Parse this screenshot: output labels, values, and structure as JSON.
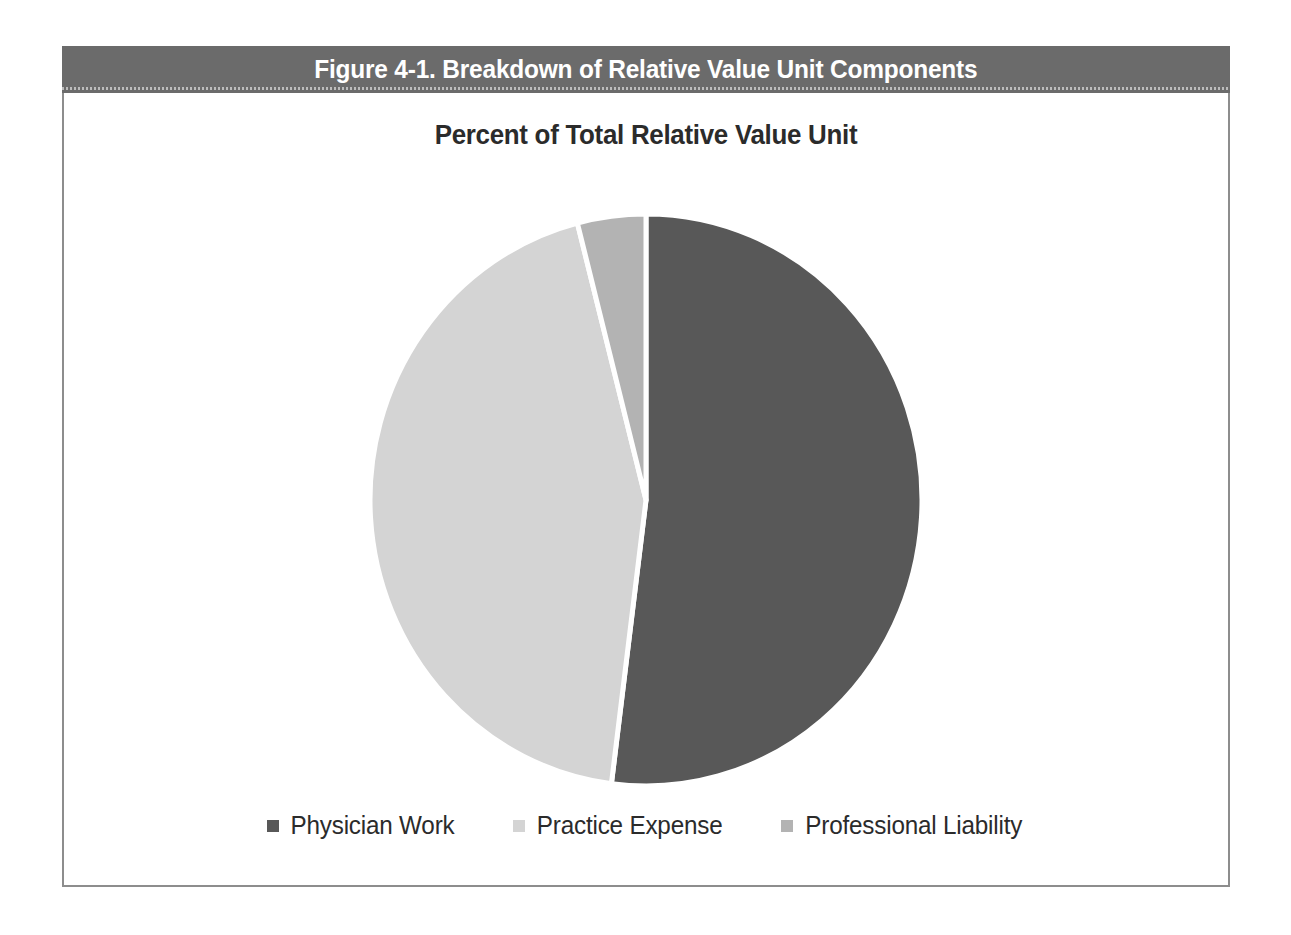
{
  "figure": {
    "header_title": "Figure 4-1. Breakdown of Relative Value Unit Components",
    "header_bg": "#6b6b6b",
    "frame_border": "#8d8d8d"
  },
  "chart_data": {
    "type": "pie",
    "title": "Percent of Total Relative Value Unit",
    "xlabel": "",
    "ylabel": "",
    "categories": [
      "Physician Work",
      "Practice Expense",
      "Professional Liability"
    ],
    "values": [
      52,
      44,
      4
    ],
    "units": "percent",
    "colors": [
      "#585858",
      "#d4d4d4",
      "#b3b3b3"
    ],
    "slice_separator_color": "#ffffff",
    "start_angle_deg": 0,
    "direction": "clockwise",
    "grid": false,
    "legend_position": "bottom",
    "data_labels_visible": false,
    "slices": [
      {
        "label": "Physician Work",
        "value": 52,
        "color": "#585858",
        "start_deg": 0,
        "end_deg": 187.2
      },
      {
        "label": "Practice Expense",
        "value": 44,
        "color": "#d4d4d4",
        "start_deg": 187.2,
        "end_deg": 345.6
      },
      {
        "label": "Professional Liability",
        "value": 4,
        "color": "#b3b3b3",
        "start_deg": 345.6,
        "end_deg": 360
      }
    ]
  },
  "legend": {
    "items": [
      {
        "label": "Physician Work",
        "marker": "square-marker-dark",
        "color": "#585858"
      },
      {
        "label": "Practice Expense",
        "marker": "square-marker-light",
        "color": "#d4d4d4"
      },
      {
        "label": "Professional Liability",
        "marker": "square-marker-medium",
        "color": "#b3b3b3"
      }
    ]
  }
}
